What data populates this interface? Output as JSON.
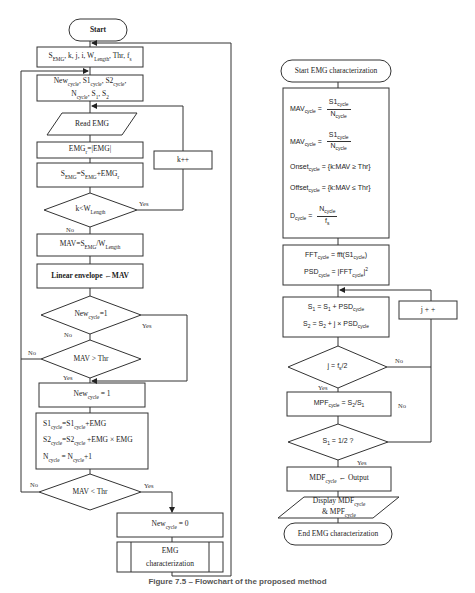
{
  "left_flowchart": {
    "start": "Start",
    "init_params": "S_EMG, k, j, i, W_Length, Thr, f_s",
    "init_cycle": [
      "New_cycle, S1_cycle, S2_cycle,",
      "N_cycle, S_1, S_2"
    ],
    "read_emg": "Read EMG",
    "rectify": "EMG_r=|EMG|",
    "sum": "S_EMG=S_EMG+EMG_r",
    "decision_window": "k<W_Length",
    "k_increment": "k++",
    "mav": "MAV=S_EMG/W_Length",
    "linear_envelope": "Linear envelope ←MAV",
    "decision_new_cycle": "New_cycle=1",
    "decision_mav_gt": "MAV > Thr",
    "set_new_cycle": "New_cycle = 1",
    "accumulate": [
      "S1_cycle=S1_cycle+EMG",
      "S2_cycle=S2_cycle +EMG × EMG",
      "N_cycle = N_cycle+1"
    ],
    "decision_mav_lt": "MAV < Thr",
    "reset_new_cycle": "New_cycle = 0",
    "subprocess": [
      "EMG",
      "characterization"
    ],
    "labels": {
      "yes": "Yes",
      "no": "No"
    }
  },
  "right_flowchart": {
    "start": "Start EMG characterization",
    "metrics": [
      "MAV_cycle = S1_cycle / N_cycle",
      "MAV_cycle = S1_cycle / N_cycle",
      "Onset_cycle = {k:MAV ≥ Thr}",
      "Offset_cycle = {k:MAV ≤ Thr}",
      "D_cycle = N_cycle / f_s"
    ],
    "fft": [
      "FFT_cycle = fft(S1_cycle)",
      "PSD_cycle = |FFT_cycle|^2"
    ],
    "spectral_sums": [
      "S_1 = S_1 + PSD_cycle",
      "S_2 = S_2 + j × PSD_cycle"
    ],
    "j_increment": "j + +",
    "decision_j": "j = f_s/2",
    "mpf": "MPF_cycle = S_2/S_1",
    "decision_s1": "S_1 = 1/2 ?",
    "mdf": "MDF_cycle ← Output",
    "display": [
      "Display MDF_cycle",
      "& MPF_cycle"
    ],
    "end": "End EMG characterization",
    "labels": {
      "yes": "Yes",
      "no": "No"
    }
  },
  "caption": "Figure 7.5 – Flowchart of the proposed method"
}
